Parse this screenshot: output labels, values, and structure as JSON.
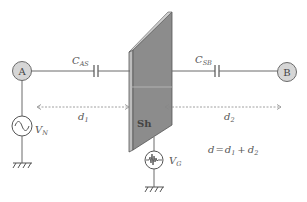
{
  "diagram": {
    "nodes": {
      "a": {
        "label": "A"
      },
      "b": {
        "label": "B"
      }
    },
    "capacitors": {
      "cas": {
        "label_main": "C",
        "label_sub": "AS"
      },
      "csb": {
        "label_main": "C",
        "label_sub": "SB"
      }
    },
    "plate": {
      "label": "Sh"
    },
    "sources": {
      "vn": {
        "label_main": "V",
        "label_sub": "N",
        "type": "ac-sine-source"
      },
      "vg": {
        "label_main": "V",
        "label_sub": "G",
        "type": "noise-source"
      }
    },
    "distances": {
      "d1": {
        "label_main": "d",
        "label_sub": "1"
      },
      "d2": {
        "label_main": "d",
        "label_sub": "2"
      }
    },
    "equation": {
      "lhs": "d",
      "eq": "=",
      "t1_main": "d",
      "t1_sub": "1",
      "plus": "+",
      "t2_main": "d",
      "t2_sub": "2"
    },
    "colors": {
      "plate_fill": "#8c8c8c",
      "plate_edge": "#bdbdbd",
      "node_fill": "#d6d6d6",
      "wire": "#6a6a6a"
    }
  }
}
